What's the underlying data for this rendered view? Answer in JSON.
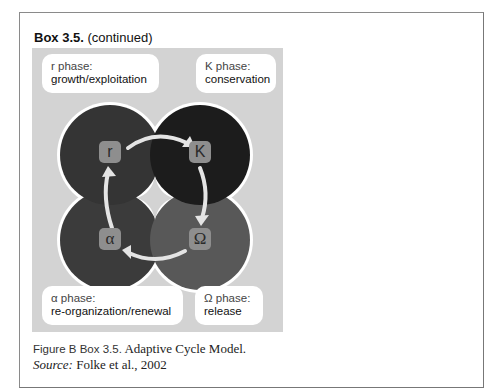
{
  "box": {
    "title_bold": "Box 3.5.",
    "title_rest": " (continued)"
  },
  "figure": {
    "phases": [
      {
        "id": "r",
        "symbol": "r",
        "label_line1": "r phase:",
        "label_line2": "growth/exploitation",
        "color": "#343434"
      },
      {
        "id": "K",
        "symbol": "K",
        "label_line1": "K phase:",
        "label_line2": "conservation",
        "color": "#1c1c1c"
      },
      {
        "id": "alpha",
        "symbol": "α",
        "label_line1": "α phase:",
        "label_line2": "re-organization/renewal",
        "color": "#3b3b3b"
      },
      {
        "id": "omega",
        "symbol": "Ω",
        "label_line1": "Ω phase:",
        "label_line2": "release",
        "color": "#585858"
      }
    ],
    "background_color": "#d3d3d3"
  },
  "caption": {
    "fig_label": "Figure B Box 3.5.",
    "fig_title": " Adaptive Cycle Model.",
    "source_label": "Source:",
    "source_text": " Folke et al., 2002"
  }
}
